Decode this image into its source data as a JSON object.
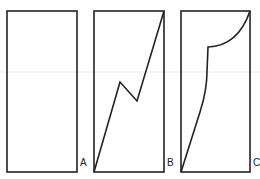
{
  "figure": {
    "panels": [
      {
        "id": "A",
        "label": "A",
        "content": "empty-rectangle"
      },
      {
        "id": "B",
        "label": "B",
        "content": "zigzag-line"
      },
      {
        "id": "C",
        "label": "C",
        "content": "curved-line"
      }
    ],
    "colors": {
      "stroke": "#222222",
      "background": "#ffffff",
      "scan_line": "#e6e6e6"
    }
  }
}
